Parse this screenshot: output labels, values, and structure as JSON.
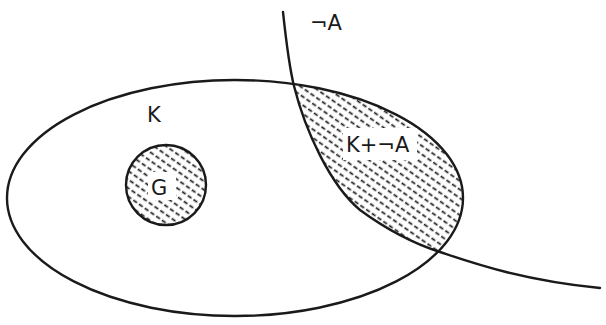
{
  "diagram": {
    "type": "set-diagram",
    "labels": {
      "K": "K",
      "G": "G",
      "notA": "¬A",
      "revision": "K+¬A"
    },
    "regions": [
      {
        "name": "K",
        "shape": "ellipse",
        "shaded": false
      },
      {
        "name": "G",
        "shape": "circle",
        "shaded": true,
        "inside": "K"
      },
      {
        "name": "¬A",
        "shape": "open-curve",
        "shaded": false
      },
      {
        "name": "K+¬A",
        "shape": "lens",
        "shaded": true,
        "description": "intersection of K and ¬A"
      }
    ],
    "colors": {
      "line": "#1a1a1a",
      "background": "#ffffff"
    }
  }
}
